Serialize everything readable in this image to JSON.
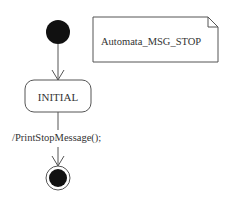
{
  "diagram": {
    "type": "UML state machine",
    "note": {
      "text": "Automata_MSG_STOP"
    },
    "states": [
      {
        "id": "initial-pseudostate",
        "kind": "initial"
      },
      {
        "id": "INITIAL",
        "kind": "state",
        "label": "INITIAL"
      },
      {
        "id": "final-state",
        "kind": "final"
      }
    ],
    "transitions": [
      {
        "from": "initial-pseudostate",
        "to": "INITIAL",
        "label": ""
      },
      {
        "from": "INITIAL",
        "to": "final-state",
        "label": "/PrintStopMessage();"
      }
    ],
    "colors": {
      "stroke": "#555555",
      "fill": "#111111",
      "text": "#333333"
    }
  }
}
